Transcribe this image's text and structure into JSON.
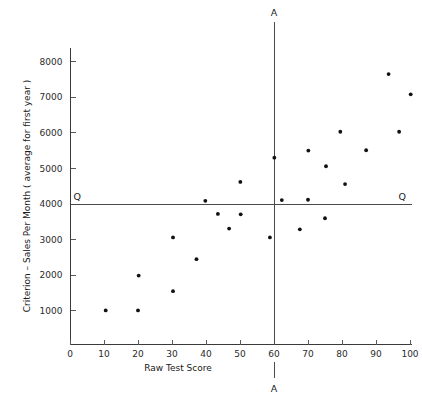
{
  "chart_data": {
    "type": "scatter",
    "title": "",
    "xlabel": "Raw Test Score",
    "ylabel": "Criterion – Sales Per Month  ( average for first year )",
    "xlim": [
      0,
      108
    ],
    "ylim": [
      0,
      8700
    ],
    "grid": false,
    "legend": null,
    "x_ticks": [
      0,
      10,
      20,
      30,
      40,
      50,
      60,
      70,
      80,
      90,
      100
    ],
    "x_tick_labels": [
      "0",
      "10",
      "20",
      "30",
      "40",
      "50",
      "60",
      "70",
      "80",
      "90",
      "100"
    ],
    "y_ticks": [
      1000,
      2000,
      3000,
      4000,
      5000,
      6000,
      7000,
      8000
    ],
    "y_tick_labels": [
      "1000",
      "2000",
      "3000",
      "4000",
      "5000",
      "6000",
      "7000",
      "8000"
    ],
    "annotations": {
      "vertical_cut_label_top": "A",
      "vertical_cut_label_bottom": "A",
      "horizontal_cut_label_left": "Q",
      "horizontal_cut_label_right": "Q",
      "vertical_cut_value": 60,
      "horizontal_cut_value": 4000
    },
    "points": [
      {
        "x": 10.5,
        "y": 1010
      },
      {
        "x": 20.0,
        "y": 1010
      },
      {
        "x": 20.2,
        "y": 1990
      },
      {
        "x": 30.3,
        "y": 1550
      },
      {
        "x": 30.3,
        "y": 3060
      },
      {
        "x": 37.2,
        "y": 2450
      },
      {
        "x": 39.8,
        "y": 4090
      },
      {
        "x": 43.5,
        "y": 3720
      },
      {
        "x": 46.8,
        "y": 3310
      },
      {
        "x": 50.1,
        "y": 4620
      },
      {
        "x": 50.2,
        "y": 3710
      },
      {
        "x": 58.8,
        "y": 3060
      },
      {
        "x": 60.1,
        "y": 5300
      },
      {
        "x": 62.3,
        "y": 4110
      },
      {
        "x": 67.6,
        "y": 3290
      },
      {
        "x": 70.0,
        "y": 4120
      },
      {
        "x": 70.1,
        "y": 5500
      },
      {
        "x": 75.0,
        "y": 3600
      },
      {
        "x": 75.3,
        "y": 5060
      },
      {
        "x": 79.5,
        "y": 6030
      },
      {
        "x": 80.9,
        "y": 4560
      },
      {
        "x": 87.1,
        "y": 5510
      },
      {
        "x": 93.7,
        "y": 7650
      },
      {
        "x": 96.8,
        "y": 6030
      },
      {
        "x": 100.2,
        "y": 7080
      }
    ]
  },
  "axis": {
    "x_title": "Raw Test Score",
    "y_title": "Criterion – Sales Per Month  ( average for first year )"
  },
  "cut_labels": {
    "top": "A",
    "bottom": "A",
    "left": "Q",
    "right": "Q"
  }
}
